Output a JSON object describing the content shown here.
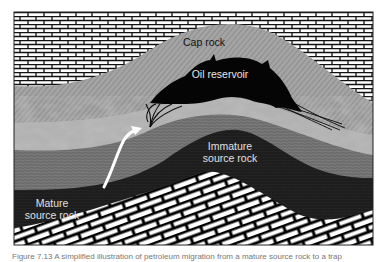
{
  "figure": {
    "type": "geological cross-section",
    "layers": [
      {
        "name": "overlying-rock",
        "pattern": "white brick",
        "color": "#ffffff"
      },
      {
        "name": "cap-rock",
        "pattern": "diagonal hatch gray",
        "color": "#9a9a9a"
      },
      {
        "name": "oil-reservoir",
        "pattern": "solid black",
        "color": "#050505"
      },
      {
        "name": "carrier-bed",
        "pattern": "mottled light gray",
        "color": "#b4b4b4"
      },
      {
        "name": "shale",
        "pattern": "wavy gray texture",
        "color": "#6e6e6e"
      },
      {
        "name": "source-rock",
        "pattern": "dark",
        "color": "#1e1e1e"
      },
      {
        "name": "basement",
        "pattern": "tilted white brick",
        "color": "#ffffff"
      }
    ],
    "labels": {
      "cap_rock": "Cap rock",
      "oil_reservoir": "Oil reservoir",
      "immature_line1": "Immature",
      "immature_line2": "source rock",
      "mature_line1": "Mature",
      "mature_line2": "source rock"
    },
    "migration_arrow": "white curved arrow from mature source rock up to reservoir"
  },
  "caption": {
    "text": "Figure 7.13  A simplified illustration of petroleum migration from a mature source rock to a trap"
  }
}
